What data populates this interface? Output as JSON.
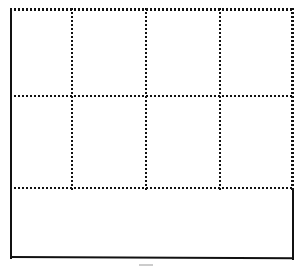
{
  "document": {
    "kind": "scanned-blank-table",
    "page_background": "#ffffff",
    "ink_color": "#111111",
    "width_px": 302,
    "height_px": 270
  },
  "table": {
    "name": "blank-grid-table",
    "origin_x_px": 10,
    "origin_y_px": 8,
    "width_px": 283,
    "height_px": 250,
    "column_count": 4,
    "row_count": 3,
    "cell_text": "",
    "borders": {
      "top": "dotted",
      "right_upper": "dotted",
      "right_lower": "solid",
      "bottom": "solid",
      "left": "solid",
      "interior": "dotted"
    },
    "dot_pitch_px": 4,
    "dot_size_px": 2,
    "column_dividers_x_px": [
      71,
      145,
      219
    ],
    "row_dividers_y_px": [
      96,
      188
    ],
    "right_edge_style_break_y_px": 190,
    "columns": [
      {
        "index": 0,
        "label": "",
        "left_px": 10,
        "right_px": 71
      },
      {
        "index": 1,
        "label": "",
        "left_px": 71,
        "right_px": 145
      },
      {
        "index": 2,
        "label": "",
        "left_px": 145,
        "right_px": 219
      },
      {
        "index": 3,
        "label": "",
        "left_px": 219,
        "right_px": 293
      }
    ],
    "rows": [
      {
        "index": 0,
        "label": "",
        "top_px": 8,
        "bottom_px": 96,
        "spans_full_width": false,
        "cells": [
          "",
          "",
          "",
          ""
        ]
      },
      {
        "index": 1,
        "label": "",
        "top_px": 96,
        "bottom_px": 188,
        "spans_full_width": false,
        "cells": [
          "",
          "",
          "",
          ""
        ]
      },
      {
        "index": 2,
        "label": "",
        "top_px": 188,
        "bottom_px": 258,
        "spans_full_width": true,
        "cells": [
          ""
        ]
      }
    ]
  },
  "artifacts": [
    {
      "name": "scan-speck",
      "x_px": 139,
      "y_px": 264,
      "width_px": 14
    }
  ]
}
